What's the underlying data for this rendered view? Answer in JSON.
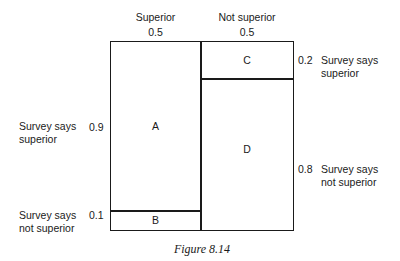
{
  "columns": [
    {
      "label": "Superior",
      "value": "0.5"
    },
    {
      "label": "Not superior",
      "value": "0.5"
    }
  ],
  "left_column_rows": [
    {
      "value": "0.9",
      "label_line1": "Survey says",
      "label_line2": "superior"
    },
    {
      "value": "0.1",
      "label_line1": "Survey says",
      "label_line2": "not superior"
    }
  ],
  "right_column_rows": [
    {
      "value": "0.2",
      "label_line1": "Survey says",
      "label_line2": "superior"
    },
    {
      "value": "0.8",
      "label_line1": "Survey says",
      "label_line2": "not superior"
    }
  ],
  "cells": {
    "A": "A",
    "B": "B",
    "C": "C",
    "D": "D"
  },
  "caption": "Figure 8.14"
}
